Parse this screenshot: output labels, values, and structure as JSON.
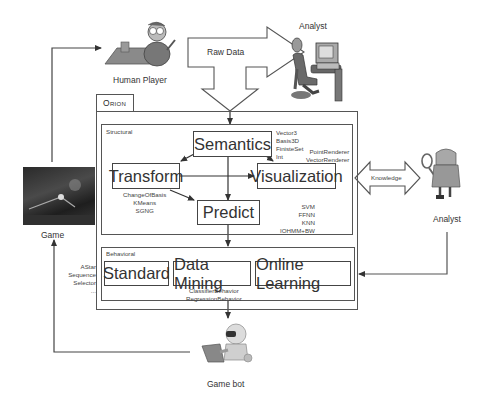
{
  "actors": {
    "human_player": "Human Player",
    "analyst_top": "Analyst",
    "analyst_right": "Analyst",
    "game": "Game",
    "game_bot": "Game bot"
  },
  "flows": {
    "raw_data": "Raw Data",
    "knowledge": "Knowledge"
  },
  "orion": {
    "title": "Orion",
    "structural": {
      "label": "Structural",
      "modules": {
        "semantics": "Semantics",
        "transform": "Transform",
        "visualization": "Visualization",
        "predict": "Predict"
      },
      "annotations": {
        "semantics": "Vector3\nBasis3D\nFinisteSet\nInt",
        "transform": "ChangeOfBasis\nKMeans\nSGNG",
        "visualization": "PointRenderer\nVectorRenderer",
        "predict": "SVM\nFFNN\nKNN\nIOHMM+BW"
      }
    },
    "behavioral": {
      "label": "Behavioral",
      "modules": {
        "standard": "Standard",
        "data_mining": "Data Mining",
        "online_learning": "Online Learning"
      },
      "annotations": {
        "standard": "AStar\nSequence\nSelector\n...",
        "data_mining": "ClassifierBehavior\nRegressionBehavior"
      }
    }
  },
  "colors": {
    "line": "#444444",
    "box_border": "#444444",
    "background": "#ffffff"
  }
}
